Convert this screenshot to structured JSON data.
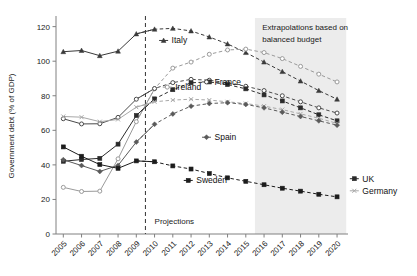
{
  "chart_data": {
    "type": "line",
    "title": "",
    "xlabel": "",
    "ylabel": "Government debt (% of GDP)",
    "ylim": [
      0,
      125
    ],
    "yticks": [
      0,
      20,
      40,
      60,
      80,
      100,
      120
    ],
    "grid": false,
    "legend_position": "inline-labels",
    "x": [
      2005,
      2006,
      2007,
      2008,
      2009,
      2010,
      2011,
      2012,
      2013,
      2014,
      2015,
      2016,
      2017,
      2018,
      2019,
      2020
    ],
    "categories": [
      "2005",
      "2006",
      "2007",
      "2008",
      "2009",
      "2010",
      "2011",
      "2012",
      "2013",
      "2014",
      "2015",
      "2016",
      "2017",
      "2018",
      "2019",
      "2020"
    ],
    "annotations": [
      {
        "name": "projections",
        "text": "Projections",
        "x": 2010.0,
        "y": 6
      },
      {
        "name": "extrapolations",
        "text": "Extrapolations based on",
        "x": 2015.9,
        "y": 118
      },
      {
        "name": "extrapolations-2",
        "text": "balanced budget",
        "x": 2015.9,
        "y": 111
      }
    ],
    "projection_divider_x": 2009.5,
    "shaded_region": {
      "x_start": 2015.5,
      "x_end": 2020.5,
      "label": "Extrapolations based on balanced budget"
    },
    "series": [
      {
        "name": "Italy",
        "color": "#3a3a3a",
        "marker": "triangle",
        "label": "Italy",
        "label_x": 2010.25,
        "label_y": 112,
        "values": [
          105.5,
          106.2,
          103.2,
          105.8,
          115.8,
          118.5,
          119.0,
          117.5,
          114.0,
          110.0,
          105.0,
          99.5,
          94.0,
          88.5,
          83.0,
          78.0
        ]
      },
      {
        "name": "Ireland",
        "color": "#9a9a9a",
        "marker": "circle",
        "label": "Ireland",
        "label_x": 2010.45,
        "label_y": 85,
        "values": [
          27.0,
          24.6,
          24.8,
          43.5,
          65.0,
          84.0,
          96.0,
          99.5,
          104.0,
          106.5,
          107.0,
          105.0,
          101.5,
          97.0,
          92.5,
          88.0
        ]
      },
      {
        "name": "France",
        "color": "#4a4a4a",
        "marker": "circle",
        "label": "France",
        "label_x": 2012.6,
        "label_y": 88,
        "values": [
          66.7,
          63.7,
          63.8,
          67.5,
          78.0,
          84.2,
          87.6,
          89.5,
          89.0,
          87.5,
          85.5,
          83.0,
          80.0,
          76.5,
          73.0,
          70.0
        ]
      },
      {
        "name": "UK",
        "color": "#2b2b2b",
        "marker": "square",
        "label": "UK",
        "label_x": 2020.7,
        "label_y": 32,
        "values": [
          42.1,
          43.1,
          43.8,
          52.0,
          68.6,
          78.2,
          83.5,
          87.5,
          88.0,
          86.5,
          84.0,
          80.5,
          77.0,
          73.0,
          69.0,
          65.5
        ]
      },
      {
        "name": "Germany",
        "color": "#a8a8a8",
        "marker": "x",
        "label": "Germany",
        "label_x": 2020.7,
        "label_y": 25,
        "values": [
          68.0,
          67.6,
          65.0,
          66.3,
          73.4,
          76.5,
          77.5,
          78.0,
          77.5,
          76.5,
          75.5,
          74.0,
          72.0,
          69.5,
          67.0,
          64.0
        ]
      },
      {
        "name": "Spain",
        "color": "#5a5a5a",
        "marker": "diamond",
        "label": "Spain",
        "label_x": 2012.6,
        "label_y": 56,
        "values": [
          43.0,
          39.6,
          36.2,
          39.7,
          53.2,
          63.5,
          69.5,
          74.0,
          75.5,
          76.0,
          75.0,
          73.0,
          70.5,
          68.0,
          65.5,
          63.0
        ]
      },
      {
        "name": "Sweden",
        "color": "#1c1c1c",
        "marker": "square",
        "label": "Sweden",
        "label_x": 2011.6,
        "label_y": 31,
        "values": [
          50.4,
          45.0,
          40.2,
          38.0,
          42.3,
          41.8,
          39.4,
          37.6,
          35.0,
          32.5,
          30.5,
          28.5,
          26.5,
          24.8,
          23.0,
          21.5
        ]
      }
    ]
  },
  "axes": {
    "y_title": "Government debt (% of GDP)",
    "y_tick_labels": [
      "0",
      "20",
      "40",
      "60",
      "80",
      "100",
      "120"
    ],
    "x_tick_labels": [
      "2005",
      "2006",
      "2007",
      "2008",
      "2009",
      "2010",
      "2011",
      "2012",
      "2013",
      "2014",
      "2015",
      "2016",
      "2017",
      "2018",
      "2019",
      "2020"
    ]
  },
  "labels": {
    "projections": "Projections",
    "extrapolation_line1": "Extrapolations based on",
    "extrapolation_line2": "balanced budget"
  },
  "series_labels": {
    "italy": "Italy",
    "ireland": "Ireland",
    "france": "France",
    "spain": "Spain",
    "sweden": "Sweden",
    "uk": "UK",
    "germany": "Germany"
  }
}
